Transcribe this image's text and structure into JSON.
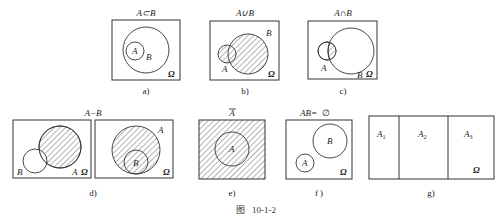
{
  "figure": {
    "caption_prefix": "图",
    "caption_number": "10-1-2",
    "universe_symbol": "Ω"
  },
  "panels": [
    {
      "id": "a",
      "label": "a)",
      "title": "A⊂B",
      "sets": [
        "A",
        "B"
      ],
      "shaded": "none",
      "relation": "A subset of B"
    },
    {
      "id": "b",
      "label": "b)",
      "title": "A∪B",
      "sets": [
        "A",
        "B"
      ],
      "shaded": "A union B",
      "relation": "overlapping"
    },
    {
      "id": "c",
      "label": "c)",
      "title": "A∩B",
      "sets": [
        "A",
        "B"
      ],
      "shaded": "A intersect B",
      "relation": "overlapping"
    },
    {
      "id": "d",
      "label": "d)",
      "title": "A−B",
      "sets": [
        "A",
        "B"
      ],
      "shaded": "A minus B",
      "relation": "two cases: overlapping and B inside A"
    },
    {
      "id": "e",
      "label": "e)",
      "title": "Ā",
      "title_base": "A",
      "sets": [
        "A"
      ],
      "shaded": "complement of A",
      "relation": "complement"
    },
    {
      "id": "f",
      "label": "f )",
      "title": "AB=∅",
      "title_lhs": "AB",
      "title_rhs": "∅",
      "sets": [
        "A",
        "B"
      ],
      "shaded": "none",
      "relation": "disjoint"
    },
    {
      "id": "g",
      "label": "g)",
      "title": "",
      "sets": [
        "A1",
        "A2",
        "A3"
      ],
      "set_labels": [
        {
          "base": "A",
          "sub": "1"
        },
        {
          "base": "A",
          "sub": "2"
        },
        {
          "base": "A",
          "sub": "3"
        }
      ],
      "shaded": "none",
      "relation": "partition of Ω"
    }
  ],
  "texts": {
    "a_title": "A⊂B",
    "a_label": "a)",
    "a_setA": "A",
    "a_setB": "B",
    "b_title": "A∪B",
    "b_label": "b)",
    "b_setA": "A",
    "b_setB": "B",
    "c_title": "A∩B",
    "c_label": "c)",
    "c_setA": "A",
    "c_setB": "B",
    "d_title": "A−B",
    "d_label": "d)",
    "d1_setA": "A",
    "d1_setB": "B",
    "d2_setA": "A",
    "d2_setB": "B",
    "e_title": "A",
    "e_label": "e)",
    "e_setA": "A",
    "f_title_lhs": "AB=",
    "f_title_rhs": "∅",
    "f_label": "f )",
    "f_setA": "A",
    "f_setB": "B",
    "g_label": "g)",
    "g_set_base": "A",
    "g_sub1": "1",
    "g_sub2": "2",
    "g_sub3": "3",
    "omega": "Ω",
    "caption_prefix": "图",
    "caption_number": "10-1-2"
  }
}
